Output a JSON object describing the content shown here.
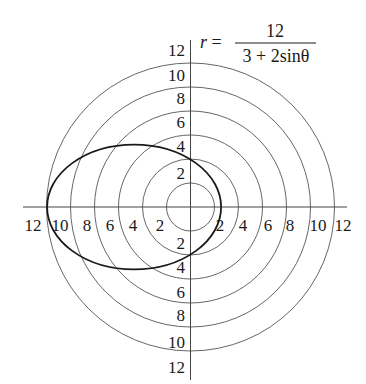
{
  "chart_data": {
    "type": "line",
    "subtype": "polar",
    "equation": {
      "lhs": "r =",
      "numerator": "12",
      "denominator": "3 + 2sinθ"
    },
    "polar_grid": {
      "circle_radii": [
        2,
        4,
        6,
        8,
        10,
        12
      ],
      "rmax": 12,
      "grid": true
    },
    "axes": {
      "x_ticks_left": [
        "12",
        "10",
        "8",
        "6",
        "4",
        "2"
      ],
      "x_ticks_right": [
        "2",
        "4",
        "6",
        "8",
        "10",
        "12"
      ],
      "y_ticks_top": [
        "12",
        "10",
        "8",
        "6",
        "4",
        "2"
      ],
      "y_ticks_bottom": [
        "2",
        "4",
        "6",
        "8",
        "10",
        "12"
      ],
      "xlim": [
        -12,
        12
      ],
      "ylim": [
        -12,
        12
      ]
    },
    "series": [
      {
        "name": "r = 12/(3 + 2sinθ)",
        "shape": "ellipse",
        "center": [
          -4.7,
          0
        ],
        "semi_axis_x": 7.25,
        "semi_axis_y": 5.2,
        "leftmost_x": -12,
        "rightmost_x": 2.5,
        "y_intercepts": [
          4,
          -4
        ],
        "color": "#1a1a1a"
      }
    ],
    "legend": null
  }
}
